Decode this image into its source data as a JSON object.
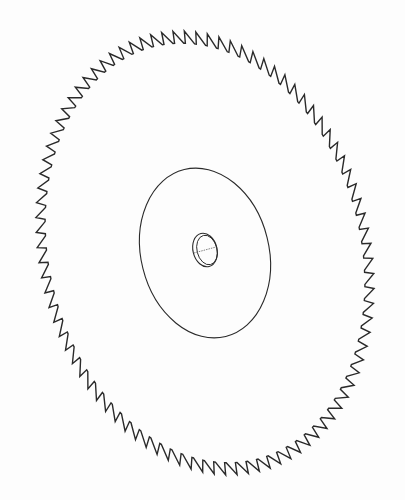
{
  "figure": {
    "background": "#fdfdfd",
    "stroke": "#2a2a2a",
    "blade": {
      "cx": 205,
      "cy": 253,
      "rx": 165,
      "ry": 225,
      "rotation": -14,
      "teeth": 92,
      "tooth_depth": 9
    },
    "hub": {
      "cx": 205,
      "cy": 253,
      "rx": 64,
      "ry": 86,
      "rotation": -14
    },
    "bore": {
      "cx": 205,
      "cy": 250,
      "rx": 12,
      "ry": 17,
      "rotation": -14
    }
  }
}
